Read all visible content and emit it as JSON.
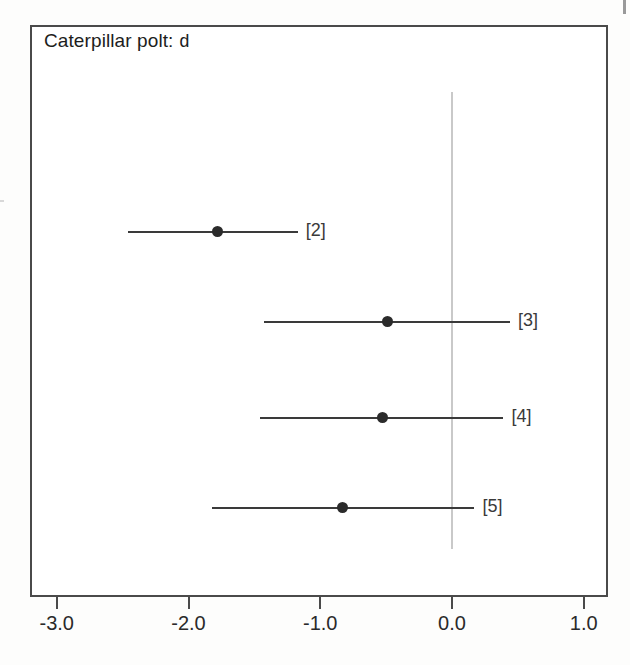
{
  "figure": {
    "title": "Caterpillar polt: d",
    "title_prefix": "Caterpillar polt:",
    "title_suffix": "d",
    "background_color": "#ffffff",
    "frame_color": "#4a4a4a",
    "point_color": "#2b2b2b",
    "line_color": "#3a3a3a",
    "zero_line_color": "#c9c9c9"
  },
  "axis": {
    "tick_labels": [
      "-3.0",
      "-2.0",
      "-1.0",
      "0.0",
      "1.0"
    ],
    "tick_values": [
      -3.0,
      -2.0,
      -1.0,
      0.0,
      1.0
    ],
    "xlim": [
      -3.2,
      1.18
    ]
  },
  "chart_data": {
    "type": "scatter",
    "title": "Caterpillar polt: d",
    "xlabel": "",
    "ylabel": "",
    "xlim": [
      -3.2,
      1.18
    ],
    "xticks": [
      -3.0,
      -2.0,
      -1.0,
      0.0,
      1.0
    ],
    "xticklabels": [
      "-3.0",
      "-2.0",
      "-1.0",
      "0.0",
      "1.0"
    ],
    "grid": false,
    "legend": "none",
    "reference_line": 0.0,
    "orientation": "horizontal",
    "series": [
      {
        "name": "[2]",
        "estimate": -1.78,
        "ci_low": -2.46,
        "ci_high": -1.17
      },
      {
        "name": "[3]",
        "estimate": -0.49,
        "ci_low": -1.43,
        "ci_high": 0.44
      },
      {
        "name": "[4]",
        "estimate": -0.53,
        "ci_low": -1.46,
        "ci_high": 0.39
      },
      {
        "name": "[5]",
        "estimate": -0.83,
        "ci_low": -1.82,
        "ci_high": 0.17
      }
    ],
    "annotations": [
      "[2]",
      "[3]",
      "[4]",
      "[5]"
    ]
  }
}
